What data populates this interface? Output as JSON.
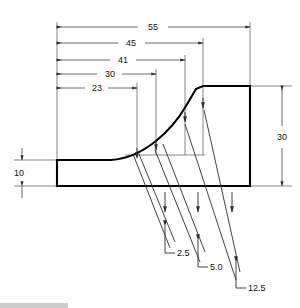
{
  "drawing": {
    "title": "Fillet transition profile dimensioned drawing",
    "units_note": "",
    "line_color": "#000000",
    "dimension_color": "#3a3a3a",
    "background": "#ffffff"
  },
  "horizontal_dimensions": [
    {
      "label": "55",
      "value": 55,
      "x_start": 57,
      "x_end": 250,
      "y": 27
    },
    {
      "label": "45",
      "value": 45,
      "x_start": 57,
      "x_end": 203,
      "y": 43
    },
    {
      "label": "41",
      "value": 41,
      "x_start": 57,
      "x_end": 185,
      "y": 60
    },
    {
      "label": "30",
      "value": 30,
      "x_start": 57,
      "x_end": 156,
      "y": 74
    },
    {
      "label": "23",
      "value": 23,
      "x_start": 57,
      "x_end": 137,
      "y": 88
    }
  ],
  "vertical_dimensions": [
    {
      "label": "30",
      "value": 30,
      "x": 282,
      "y_start": 86,
      "y_end": 186
    },
    {
      "label": "10",
      "value": 10,
      "x": 22,
      "y_start": 155,
      "y_end": 187
    }
  ],
  "ordinate_callouts": [
    {
      "label": "2.5",
      "value": 2.5
    },
    {
      "label": "5.0",
      "value": 5.0
    },
    {
      "label": "12.5",
      "value": 12.5
    }
  ],
  "profile": {
    "left_edge_x": 57,
    "right_edge_x": 250,
    "top_y": 86,
    "base_top_y": 160,
    "base_bottom_y": 186,
    "curve_start_x": 111,
    "curve_end_x": 205,
    "chamfer_x": 222
  }
}
